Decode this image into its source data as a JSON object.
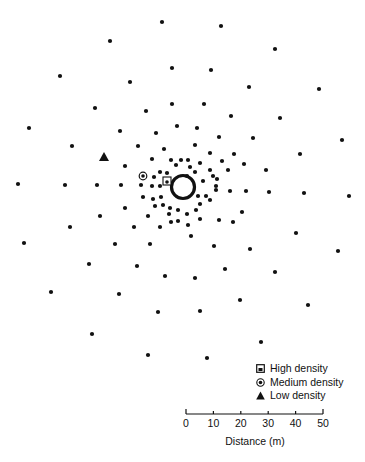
{
  "figure": {
    "type": "point-distribution-diagram",
    "center": {
      "x": 183,
      "y": 187,
      "ring_radius": 12
    },
    "dot_color": "#111111",
    "dots": [
      [
        162,
        22
      ],
      [
        110,
        41
      ],
      [
        60,
        76
      ],
      [
        130,
        82
      ],
      [
        95,
        108
      ],
      [
        172,
        68
      ],
      [
        146,
        111
      ],
      [
        172,
        104
      ],
      [
        29,
        128
      ],
      [
        120,
        131
      ],
      [
        156,
        133
      ],
      [
        72,
        146
      ],
      [
        177,
        126
      ],
      [
        138,
        146
      ],
      [
        164,
        149
      ],
      [
        125,
        166
      ],
      [
        152,
        159
      ],
      [
        171,
        160
      ],
      [
        160,
        172
      ],
      [
        181,
        160
      ],
      [
        154,
        177
      ],
      [
        167,
        173
      ],
      [
        176,
        165
      ],
      [
        221,
        26
      ],
      [
        275,
        49
      ],
      [
        211,
        70
      ],
      [
        249,
        87
      ],
      [
        319,
        89
      ],
      [
        204,
        104
      ],
      [
        231,
        116
      ],
      [
        280,
        118
      ],
      [
        197,
        128
      ],
      [
        219,
        137
      ],
      [
        253,
        138
      ],
      [
        342,
        140
      ],
      [
        195,
        145
      ],
      [
        210,
        153
      ],
      [
        234,
        154
      ],
      [
        300,
        154
      ],
      [
        222,
        161
      ],
      [
        244,
        164
      ],
      [
        266,
        170
      ],
      [
        210,
        170
      ],
      [
        228,
        170
      ],
      [
        187,
        176
      ],
      [
        195,
        172
      ],
      [
        213,
        176
      ],
      [
        217,
        179
      ],
      [
        188,
        160
      ],
      [
        200,
        163
      ],
      [
        190,
        167
      ],
      [
        203,
        181
      ],
      [
        18,
        184
      ],
      [
        65,
        185
      ],
      [
        97,
        185
      ],
      [
        121,
        185
      ],
      [
        141,
        185
      ],
      [
        152,
        186
      ],
      [
        160,
        186
      ],
      [
        143,
        197
      ],
      [
        153,
        199
      ],
      [
        161,
        197
      ],
      [
        125,
        208
      ],
      [
        100,
        216
      ],
      [
        148,
        216
      ],
      [
        170,
        208
      ],
      [
        70,
        227
      ],
      [
        134,
        227
      ],
      [
        160,
        227
      ],
      [
        24,
        243
      ],
      [
        115,
        244
      ],
      [
        150,
        244
      ],
      [
        171,
        222
      ],
      [
        89,
        264
      ],
      [
        137,
        266
      ],
      [
        165,
        276
      ],
      [
        51,
        292
      ],
      [
        119,
        294
      ],
      [
        158,
        312
      ],
      [
        92,
        334
      ],
      [
        148,
        355
      ],
      [
        163,
        205
      ],
      [
        169,
        214
      ],
      [
        178,
        210
      ],
      [
        187,
        214
      ],
      [
        196,
        210
      ],
      [
        178,
        221
      ],
      [
        188,
        225
      ],
      [
        200,
        219
      ],
      [
        155,
        206
      ],
      [
        230,
        191
      ],
      [
        246,
        191
      ],
      [
        269,
        192
      ],
      [
        304,
        193
      ],
      [
        349,
        196
      ],
      [
        216,
        186
      ],
      [
        216,
        190
      ],
      [
        200,
        204
      ],
      [
        242,
        212
      ],
      [
        219,
        220
      ],
      [
        233,
        222
      ],
      [
        296,
        233
      ],
      [
        191,
        236
      ],
      [
        214,
        246
      ],
      [
        250,
        249
      ],
      [
        338,
        251
      ],
      [
        195,
        278
      ],
      [
        225,
        269
      ],
      [
        275,
        272
      ],
      [
        200,
        311
      ],
      [
        240,
        300
      ],
      [
        308,
        305
      ],
      [
        261,
        342
      ],
      [
        207,
        358
      ],
      [
        206,
        196
      ],
      [
        210,
        200
      ],
      [
        198,
        196
      ]
    ],
    "markers": [
      {
        "type": "high",
        "x": 167,
        "y": 181
      },
      {
        "type": "medium",
        "x": 143,
        "y": 176
      },
      {
        "type": "low",
        "x": 104,
        "y": 157
      }
    ]
  },
  "legend": {
    "items": [
      {
        "symbol": "square-dot",
        "label": "High density"
      },
      {
        "symbol": "circled-dot",
        "label": "Medium density"
      },
      {
        "symbol": "triangle",
        "label": "Low density"
      }
    ]
  },
  "scale_bar": {
    "ticks": [
      "0",
      "10",
      "20",
      "30",
      "40",
      "50"
    ],
    "title": "Distance (m)"
  }
}
